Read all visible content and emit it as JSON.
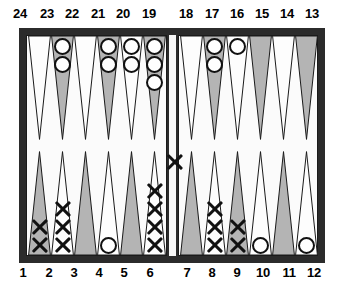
{
  "app": {
    "title": "Backgammon Board Diagram"
  },
  "colors": {
    "frame": "#2b2b2b",
    "surface": "#fbfbfb",
    "point_light": "#fdfdfd",
    "point_shaded": "#b4b4b4",
    "point_outline": "#1a1a1a",
    "checker_white_fill": "#ffffff",
    "checker_white_border": "#111111",
    "checker_black": "#111111",
    "label_text": "#000000"
  },
  "labels": {
    "top": [
      "24",
      "23",
      "22",
      "21",
      "20",
      "19",
      "18",
      "17",
      "16",
      "15",
      "14",
      "13"
    ],
    "bottom": [
      "1",
      "2",
      "3",
      "4",
      "5",
      "6",
      "7",
      "8",
      "9",
      "10",
      "11",
      "12"
    ]
  },
  "legend": {
    "white_checker": "white-circle-checker",
    "black_checker": "black-cross-checker"
  },
  "bar": {
    "name": "bar",
    "checkers": [
      {
        "color": "black"
      }
    ]
  },
  "points": [
    {
      "number": "24",
      "row": "top",
      "quadrant": "left",
      "shade": "light",
      "checkers": []
    },
    {
      "number": "23",
      "row": "top",
      "quadrant": "left",
      "shade": "shaded",
      "checkers": [
        {
          "color": "white"
        },
        {
          "color": "white"
        }
      ]
    },
    {
      "number": "22",
      "row": "top",
      "quadrant": "left",
      "shade": "light",
      "checkers": []
    },
    {
      "number": "21",
      "row": "top",
      "quadrant": "left",
      "shade": "shaded",
      "checkers": [
        {
          "color": "white"
        },
        {
          "color": "white"
        }
      ]
    },
    {
      "number": "20",
      "row": "top",
      "quadrant": "left",
      "shade": "light",
      "checkers": [
        {
          "color": "white"
        },
        {
          "color": "white"
        }
      ]
    },
    {
      "number": "19",
      "row": "top",
      "quadrant": "left",
      "shade": "shaded",
      "checkers": [
        {
          "color": "white"
        },
        {
          "color": "white"
        },
        {
          "color": "white"
        }
      ]
    },
    {
      "number": "18",
      "row": "top",
      "quadrant": "right",
      "shade": "light",
      "checkers": []
    },
    {
      "number": "17",
      "row": "top",
      "quadrant": "right",
      "shade": "shaded",
      "checkers": [
        {
          "color": "white"
        },
        {
          "color": "white"
        }
      ]
    },
    {
      "number": "16",
      "row": "top",
      "quadrant": "right",
      "shade": "light",
      "checkers": [
        {
          "color": "white"
        }
      ]
    },
    {
      "number": "15",
      "row": "top",
      "quadrant": "right",
      "shade": "shaded",
      "checkers": []
    },
    {
      "number": "14",
      "row": "top",
      "quadrant": "right",
      "shade": "light",
      "checkers": []
    },
    {
      "number": "13",
      "row": "top",
      "quadrant": "right",
      "shade": "shaded",
      "checkers": []
    },
    {
      "number": "1",
      "row": "bottom",
      "quadrant": "left",
      "shade": "shaded",
      "checkers": [
        {
          "color": "black"
        },
        {
          "color": "black"
        }
      ]
    },
    {
      "number": "2",
      "row": "bottom",
      "quadrant": "left",
      "shade": "light",
      "checkers": [
        {
          "color": "black"
        },
        {
          "color": "black"
        },
        {
          "color": "black"
        }
      ]
    },
    {
      "number": "3",
      "row": "bottom",
      "quadrant": "left",
      "shade": "shaded",
      "checkers": []
    },
    {
      "number": "4",
      "row": "bottom",
      "quadrant": "left",
      "shade": "light",
      "checkers": [
        {
          "color": "white"
        }
      ]
    },
    {
      "number": "5",
      "row": "bottom",
      "quadrant": "left",
      "shade": "shaded",
      "checkers": []
    },
    {
      "number": "6",
      "row": "bottom",
      "quadrant": "left",
      "shade": "light",
      "checkers": [
        {
          "color": "black"
        },
        {
          "color": "black"
        },
        {
          "color": "black"
        },
        {
          "color": "black"
        }
      ]
    },
    {
      "number": "7",
      "row": "bottom",
      "quadrant": "right",
      "shade": "shaded",
      "checkers": []
    },
    {
      "number": "8",
      "row": "bottom",
      "quadrant": "right",
      "shade": "light",
      "checkers": [
        {
          "color": "black"
        },
        {
          "color": "black"
        },
        {
          "color": "black"
        }
      ]
    },
    {
      "number": "9",
      "row": "bottom",
      "quadrant": "right",
      "shade": "shaded",
      "checkers": [
        {
          "color": "black"
        },
        {
          "color": "black"
        }
      ]
    },
    {
      "number": "10",
      "row": "bottom",
      "quadrant": "right",
      "shade": "light",
      "checkers": [
        {
          "color": "white"
        }
      ]
    },
    {
      "number": "11",
      "row": "bottom",
      "quadrant": "right",
      "shade": "shaded",
      "checkers": []
    },
    {
      "number": "12",
      "row": "bottom",
      "quadrant": "right",
      "shade": "light",
      "checkers": [
        {
          "color": "white"
        }
      ]
    }
  ]
}
